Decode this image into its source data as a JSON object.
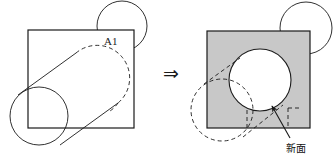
{
  "figure": {
    "title_text": "",
    "transform_arrow": "⇒",
    "stroke_color": "#1a1a1a",
    "fill_white": "#ffffff",
    "fill_gray": "#c8c8c8",
    "dash_pattern": "4 3"
  },
  "left_figure": {
    "name": "before-boolean-operation",
    "plate_label": "A1",
    "plate": {
      "x": 28,
      "y": 30,
      "width": 106,
      "height": 98,
      "fill": "#ffffff"
    },
    "top_arc_circle": {
      "cx": 122,
      "cy": 26,
      "r": 25
    },
    "cylinder_bottom_circle": {
      "cx": 39,
      "cy": 116,
      "r": 29
    },
    "cylinder_top_ellipse": {
      "cx": 97,
      "cy": 74,
      "rx": 29,
      "ry": 29,
      "style": "dashed"
    }
  },
  "right_figure": {
    "name": "after-boolean-operation",
    "new_surface_label": "新面",
    "plate": {
      "x": 207,
      "y": 31,
      "width": 103,
      "height": 97,
      "fill": "#c8c8c8"
    },
    "hole_circle": {
      "cx": 260,
      "cy": 80,
      "r": 31,
      "fill": "#ffffff"
    },
    "top_arc_circle": {
      "cx": 306,
      "cy": 28,
      "r": 26
    },
    "ghost_ellipse": {
      "cx": 222,
      "cy": 110,
      "r": 31,
      "style": "dashed"
    },
    "leader_arrow": {
      "from_x": 289,
      "from_y": 139,
      "to_x": 272,
      "to_y": 107
    }
  },
  "arrow": {
    "x": 170,
    "y": 73,
    "glyph": "⇒"
  }
}
